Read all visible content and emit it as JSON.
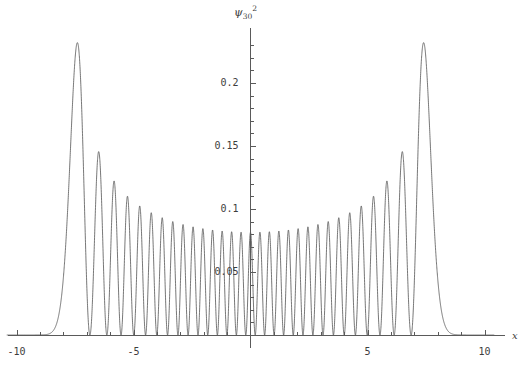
{
  "chart_data": {
    "type": "line",
    "title": "",
    "subtitle": "",
    "xlabel": "x",
    "ylabel": "psi_30^2",
    "ylabel_glyph": "ψ",
    "ylabel_sub": "30",
    "ylabel_sup": "2",
    "grid": false,
    "legend": null,
    "xlim": [
      -10.5,
      10.8
    ],
    "ylim": [
      0,
      0.245
    ],
    "xticks": [
      -10,
      -5,
      5,
      10
    ],
    "xtick_labels": [
      "-10",
      "-5",
      "5",
      "10"
    ],
    "xminor_tick_step": 1,
    "yticks": [
      0.05,
      0.1,
      0.15,
      0.2
    ],
    "ytick_labels": [
      "0.05",
      "0.1",
      "0.15",
      "0.2"
    ],
    "yminor_tick_step": 0.01,
    "series": [
      {
        "name": "|psi_30(x)|^2",
        "description": "Quantum harmonic oscillator probability density, n = 30",
        "quantum_number_n": 30,
        "turning_points": [
          -7.81,
          7.81
        ],
        "max_value": 0.232,
        "max_value_positions": [
          -7.42,
          7.42
        ],
        "center_envelope_min": 0.0755,
        "node_count": 30,
        "oscillation_half_period_center": 0.404,
        "peak_x": [
          -7.42,
          -6.61,
          -5.94,
          -5.36,
          -4.83,
          -4.34,
          -3.87,
          -3.43,
          -3.0,
          -2.58,
          -2.17,
          -1.76,
          -1.36,
          -0.96,
          -0.56,
          -0.17,
          0.17,
          0.56,
          0.96,
          1.36,
          1.76,
          2.17,
          2.58,
          3.0,
          3.43,
          3.87,
          4.34,
          4.83,
          5.36,
          5.94,
          6.61,
          7.42
        ],
        "peak_y": [
          0.232,
          0.1455,
          0.1275,
          0.1165,
          0.1095,
          0.1035,
          0.0985,
          0.0945,
          0.0905,
          0.0875,
          0.0845,
          0.0818,
          0.0795,
          0.0778,
          0.0765,
          0.0757,
          0.0757,
          0.0765,
          0.0778,
          0.0795,
          0.0818,
          0.0845,
          0.0875,
          0.0905,
          0.0945,
          0.0985,
          0.1035,
          0.1095,
          0.1165,
          0.1275,
          0.1455,
          0.232
        ]
      }
    ]
  },
  "labels": {
    "x_axis": "x",
    "y_axis": "ψ"
  }
}
